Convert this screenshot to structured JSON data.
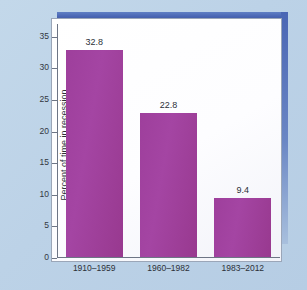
{
  "chart_data": {
    "type": "bar",
    "title": "",
    "subtitle": "",
    "xlabel": "",
    "ylabel": "Percent of time in recession",
    "categories": [
      "1910–1959",
      "1960–1982",
      "1983–2012"
    ],
    "values": [
      32.8,
      22.8,
      9.4
    ],
    "value_labels": [
      "32.8",
      "22.8",
      "9.4"
    ],
    "ylim": [
      0,
      37
    ],
    "yticks": [
      0,
      5,
      10,
      15,
      20,
      25,
      30,
      35
    ],
    "ytick_labels": [
      "0",
      "5",
      "10",
      "15",
      "20",
      "25",
      "30",
      "35"
    ],
    "grid": false,
    "legend": null,
    "bar_color": "#a0409e",
    "plot_background": "#ffffff",
    "figure_background": "#bcd2e7",
    "frame_accent_color": "#4a66b4",
    "axis_color": "#6d7585",
    "text_color": "#2c3038"
  }
}
